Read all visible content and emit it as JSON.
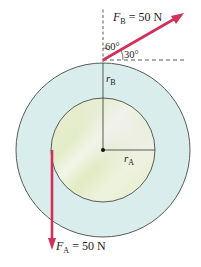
{
  "diagram": {
    "colors": {
      "outer_disc": "#d9eeec",
      "inner_disc": "#e6eed2",
      "inner_highlight": "#f1f1ea",
      "outline": "#555555",
      "force_arrow": "#d1305a",
      "dashed": "#333333",
      "background": "#ffffff"
    },
    "geometry": {
      "center": [
        103,
        150
      ],
      "outer_radius": 87,
      "inner_radius": 52
    },
    "forces": [
      {
        "id": "F_B",
        "symbol": "F",
        "subscript": "B",
        "value_text": " = 50 N",
        "magnitude": 50,
        "unit": "N",
        "direction_deg_from_horizontal": 30,
        "application_point": "top of outer disc"
      },
      {
        "id": "F_A",
        "symbol": "F",
        "subscript": "A",
        "value_text": " = 50 N",
        "magnitude": 50,
        "unit": "N",
        "direction": "downward",
        "application_point": "left edge of inner disc"
      }
    ],
    "angles": [
      {
        "label": "60°",
        "between": "vertical and F_B"
      },
      {
        "label": "30°",
        "between": "horizontal and F_B"
      }
    ],
    "radii": [
      {
        "symbol": "r",
        "subscript": "B",
        "label": "outer radius"
      },
      {
        "symbol": "r",
        "subscript": "A",
        "label": "inner radius"
      }
    ]
  }
}
